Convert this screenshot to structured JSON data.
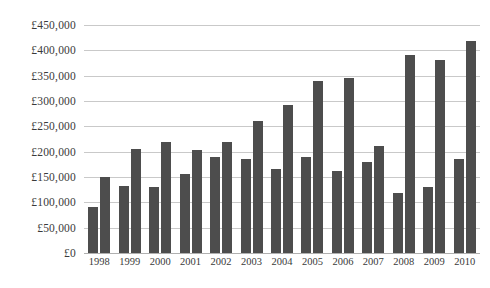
{
  "chart_data": {
    "type": "bar",
    "title": "",
    "xlabel": "",
    "ylabel": "",
    "ylim": [
      0,
      450000
    ],
    "ytick_step": 50000,
    "grid": true,
    "legend": "none",
    "currency_symbol": "£",
    "bar_color": "#4d4d4d",
    "gridline_color": "#c9c9c9",
    "categories": [
      "1998",
      "1999",
      "2000",
      "2001",
      "2002",
      "2003",
      "2004",
      "2005",
      "2006",
      "2007",
      "2008",
      "2009",
      "2010"
    ],
    "ytick_labels": [
      "£0",
      "£50,000",
      "£100,000",
      "£150,000",
      "£200,000",
      "£250,000",
      "£300,000",
      "£350,000",
      "£400,000",
      "£450,000"
    ],
    "ytick_values": [
      0,
      50000,
      100000,
      150000,
      200000,
      250000,
      300000,
      350000,
      400000,
      450000
    ],
    "series": [
      {
        "name": "Series A",
        "values": [
          90000,
          132000,
          131000,
          156000,
          190000,
          185000,
          166000,
          189000,
          161000,
          180000,
          118000,
          130000,
          185000
        ]
      },
      {
        "name": "Series B",
        "values": [
          150000,
          206000,
          220000,
          203000,
          219000,
          261000,
          292000,
          339000,
          345000,
          212000,
          391000,
          380000,
          419000
        ]
      }
    ]
  }
}
